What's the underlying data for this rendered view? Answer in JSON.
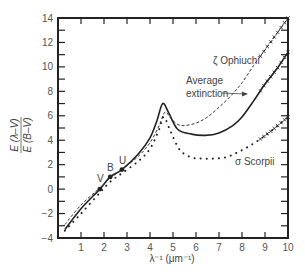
{
  "chart_data": {
    "type": "line",
    "title": "",
    "xlabel": "λ⁻¹ (μm⁻¹)",
    "ylabel_numerator": "E (λ–V)",
    "ylabel_denominator": "E (B–V)",
    "xlim": [
      0,
      10
    ],
    "ylim": [
      -4,
      14
    ],
    "x_ticks": [
      1,
      2,
      3,
      4,
      5,
      6,
      7,
      8,
      9,
      10
    ],
    "y_ticks": [
      -4,
      -2,
      0,
      2,
      4,
      6,
      8,
      10,
      12,
      14
    ],
    "grid": false,
    "series": [
      {
        "name": "Average extinction",
        "style": "solid",
        "x": [
          0.3,
          1.0,
          1.82,
          2.27,
          2.78,
          3.5,
          4.0,
          4.3,
          4.55,
          4.8,
          5.2,
          5.8,
          6.4,
          7.0,
          7.6,
          8.0,
          8.5,
          9.0,
          9.5,
          10.0
        ],
        "y": [
          -3.3,
          -1.6,
          0.0,
          1.0,
          1.6,
          2.9,
          4.2,
          5.6,
          7.0,
          6.3,
          4.9,
          4.5,
          4.4,
          4.6,
          5.2,
          5.9,
          7.2,
          8.6,
          9.8,
          11.2
        ]
      },
      {
        "name": "ζ Ophiuchi",
        "style": "dashed",
        "x": [
          0.3,
          1.0,
          1.82,
          2.27,
          2.78,
          3.5,
          4.0,
          4.4,
          4.65,
          4.9,
          5.2,
          5.5,
          6.0,
          6.5,
          7.0,
          7.5,
          8.0,
          8.5,
          9.0,
          9.5,
          10.0
        ],
        "y": [
          -2.9,
          -1.3,
          0.1,
          0.9,
          1.6,
          2.7,
          3.8,
          5.2,
          6.3,
          5.8,
          5.3,
          5.2,
          5.4,
          5.9,
          6.7,
          7.6,
          8.7,
          10.1,
          11.4,
          12.7,
          14.0
        ]
      },
      {
        "name": "σ Scorpii",
        "style": "dotted",
        "x": [
          0.3,
          1.0,
          1.82,
          2.27,
          2.78,
          3.5,
          4.0,
          4.4,
          4.6,
          4.9,
          5.3,
          5.8,
          6.3,
          6.8,
          7.3,
          7.8,
          8.3,
          8.8,
          9.3,
          10.0
        ],
        "y": [
          -3.4,
          -2.0,
          -0.3,
          0.6,
          1.3,
          2.3,
          3.3,
          4.9,
          5.9,
          4.7,
          3.2,
          2.6,
          2.5,
          2.5,
          2.6,
          3.0,
          3.5,
          4.1,
          4.8,
          5.9
        ]
      }
    ],
    "markers": [
      {
        "label": "V",
        "x": 1.82,
        "y": 0.0
      },
      {
        "label": "B",
        "x": 2.27,
        "y": 1.0
      },
      {
        "label": "U",
        "x": 2.78,
        "y": 1.6
      }
    ],
    "annotations": [
      {
        "text": "ζ Ophiuchi",
        "near_series": "ζ Ophiuchi"
      },
      {
        "text": "Average",
        "near_series": "Average extinction"
      },
      {
        "text": "extinction",
        "near_series": "Average extinction"
      },
      {
        "text": "σ Scorpii",
        "near_series": "σ Scorpii"
      }
    ],
    "x_marks_region": [
      8.8,
      10.0
    ],
    "legend_position": "none (inline labels)"
  },
  "labels": {
    "xlabel": "λ⁻¹ (μm⁻¹)",
    "ylabel_num": "E (λ–V)",
    "ylabel_den": "E (B–V)",
    "ophiuchi": "ζ Ophiuchi",
    "average_line1": "Average",
    "average_line2": "extinction",
    "scorpii": "σ Scorpii",
    "v": "V",
    "b": "B",
    "u": "U"
  }
}
